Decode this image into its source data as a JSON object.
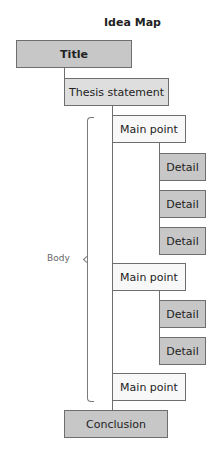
{
  "title": "Idea Map",
  "nodes": {
    "title": "Title",
    "thesis": "Thesis statement",
    "main_points": [
      {
        "label": "Main point",
        "details": [
          "Detail",
          "Detail",
          "Detail"
        ]
      },
      {
        "label": "Main point",
        "details": [
          "Detail",
          "Detail"
        ]
      },
      {
        "label": "Main point",
        "details": []
      }
    ],
    "conclusion": "Conclusion"
  },
  "body_label": "Body",
  "colors": {
    "dark_box": "#c7c7c7",
    "mid_box": "#dedede",
    "light_box": "#f8f8f8",
    "border": "#6e6e6e"
  }
}
